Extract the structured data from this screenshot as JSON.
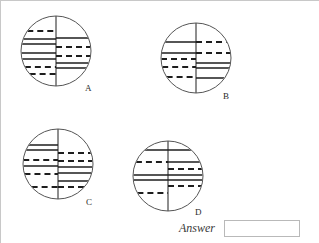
{
  "page": {
    "background_color": "#ffffff",
    "border_color": "#c8c8c8",
    "width": 319,
    "height": 243
  },
  "answer": {
    "label": "Answer",
    "value": "",
    "placeholder": ""
  },
  "figures": [
    {
      "id": "A",
      "label": "A",
      "center": {
        "x": 55,
        "y": 50
      },
      "radius": 35,
      "label_pos": {
        "x": 84,
        "y": 82
      },
      "divider": "vertical",
      "left_lines": [
        {
          "y_offset": -20,
          "style": "dashed"
        },
        {
          "y_offset": -12,
          "style": "solid"
        },
        {
          "y_offset": -7,
          "style": "solid"
        },
        {
          "y_offset": 2,
          "style": "solid"
        },
        {
          "y_offset": 8,
          "style": "solid"
        },
        {
          "y_offset": 16,
          "style": "dashed"
        },
        {
          "y_offset": 23,
          "style": "dashed"
        }
      ],
      "right_lines": [
        {
          "y_offset": -13,
          "style": "solid"
        },
        {
          "y_offset": -4,
          "style": "dashed"
        },
        {
          "y_offset": 5,
          "style": "dashed"
        },
        {
          "y_offset": 12,
          "style": "solid"
        },
        {
          "y_offset": 17,
          "style": "solid"
        }
      ]
    },
    {
      "id": "B",
      "label": "B",
      "center": {
        "x": 195,
        "y": 57
      },
      "radius": 35,
      "label_pos": {
        "x": 222,
        "y": 90
      },
      "divider": "vertical",
      "left_lines": [
        {
          "y_offset": -16,
          "style": "solid"
        },
        {
          "y_offset": -5,
          "style": "solid"
        },
        {
          "y_offset": 1,
          "style": "dashed"
        },
        {
          "y_offset": 9,
          "style": "dashed"
        },
        {
          "y_offset": 19,
          "style": "dashed"
        }
      ],
      "right_lines": [
        {
          "y_offset": -16,
          "style": "dashed"
        },
        {
          "y_offset": -5,
          "style": "dashed"
        },
        {
          "y_offset": 5,
          "style": "solid"
        },
        {
          "y_offset": 10,
          "style": "solid"
        },
        {
          "y_offset": 20,
          "style": "solid"
        }
      ]
    },
    {
      "id": "C",
      "label": "C",
      "center": {
        "x": 57,
        "y": 163
      },
      "radius": 35,
      "label_pos": {
        "x": 85,
        "y": 196
      },
      "divider": "vertical",
      "left_lines": [
        {
          "y_offset": -19,
          "style": "solid"
        },
        {
          "y_offset": -14,
          "style": "solid"
        },
        {
          "y_offset": -4,
          "style": "dashed"
        },
        {
          "y_offset": 2,
          "style": "solid"
        },
        {
          "y_offset": 10,
          "style": "dashed"
        },
        {
          "y_offset": 23,
          "style": "dashed"
        }
      ],
      "right_lines": [
        {
          "y_offset": -11,
          "style": "dashed"
        },
        {
          "y_offset": -3,
          "style": "dashed"
        },
        {
          "y_offset": 3,
          "style": "solid"
        },
        {
          "y_offset": 9,
          "style": "solid"
        },
        {
          "y_offset": 17,
          "style": "solid"
        },
        {
          "y_offset": 23,
          "style": "dashed"
        }
      ]
    },
    {
      "id": "D",
      "label": "D",
      "center": {
        "x": 167,
        "y": 175
      },
      "radius": 35,
      "label_pos": {
        "x": 194,
        "y": 206
      },
      "divider": "vertical",
      "left_lines": [
        {
          "y_offset": -26,
          "style": "solid"
        },
        {
          "y_offset": -14,
          "style": "dashed"
        },
        {
          "y_offset": -1,
          "style": "solid"
        },
        {
          "y_offset": 4,
          "style": "solid"
        },
        {
          "y_offset": 17,
          "style": "dashed"
        }
      ],
      "right_lines": [
        {
          "y_offset": -26,
          "style": "solid"
        },
        {
          "y_offset": -14,
          "style": "solid"
        },
        {
          "y_offset": -7,
          "style": "dashed"
        },
        {
          "y_offset": -1,
          "style": "solid"
        },
        {
          "y_offset": 4,
          "style": "solid"
        },
        {
          "y_offset": 10,
          "style": "dashed"
        }
      ]
    }
  ],
  "style": {
    "stroke_color": "#1e1e1e",
    "circle_stroke": "#555555",
    "dash_pattern": "6 4"
  }
}
